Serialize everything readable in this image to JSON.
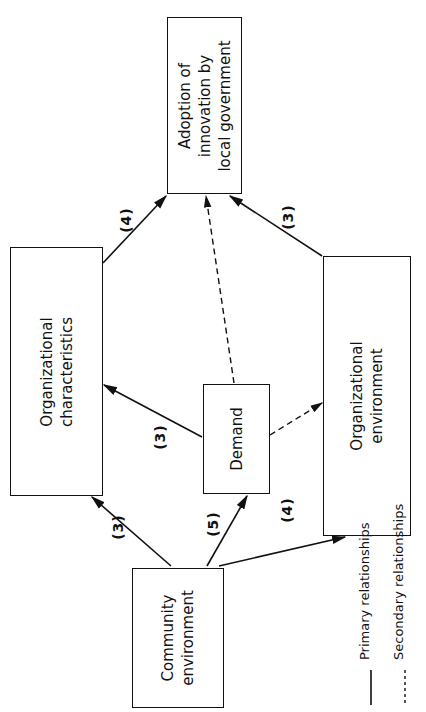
{
  "diagram": {
    "nodes": {
      "adoption": {
        "label": "Adoption of\ninnovation by\nlocal government"
      },
      "org_characteristics": {
        "label": "Organizational\ncharacteristics"
      },
      "demand": {
        "label": "Demand"
      },
      "org_environment": {
        "label": "Organizational\nenvironment"
      },
      "community_environment": {
        "label": "Community\nenvironment"
      }
    },
    "edges": [
      {
        "from": "Organizational characteristics",
        "to": "Adoption of innovation by local government",
        "type": "primary",
        "label": "(4)"
      },
      {
        "from": "Demand",
        "to": "Adoption of innovation by local government",
        "type": "secondary",
        "label": ""
      },
      {
        "from": "Organizational environment",
        "to": "Adoption of innovation by local government",
        "type": "primary",
        "label": "(3)"
      },
      {
        "from": "Demand",
        "to": "Organizational characteristics",
        "type": "primary",
        "label": "(3)"
      },
      {
        "from": "Demand",
        "to": "Organizational environment",
        "type": "secondary",
        "label": ""
      },
      {
        "from": "Community environment",
        "to": "Organizational characteristics",
        "type": "primary",
        "label": "(3)"
      },
      {
        "from": "Community environment",
        "to": "Demand",
        "type": "primary",
        "label": "(5)"
      },
      {
        "from": "Community environment",
        "to": "Organizational environment",
        "type": "primary",
        "label": "(4)"
      }
    ],
    "edge_labels": {
      "oc_to_adoption": "(4)",
      "oe_to_adoption": "(3)",
      "demand_to_oc": "(3)",
      "ce_to_oc": "(3)",
      "ce_to_demand": "(5)",
      "ce_to_oe": "(4)"
    },
    "legend": {
      "primary": "Primary relationships",
      "secondary": "Secondary relationships"
    },
    "colors": {
      "line": "#111111",
      "background": "#ffffff"
    }
  }
}
